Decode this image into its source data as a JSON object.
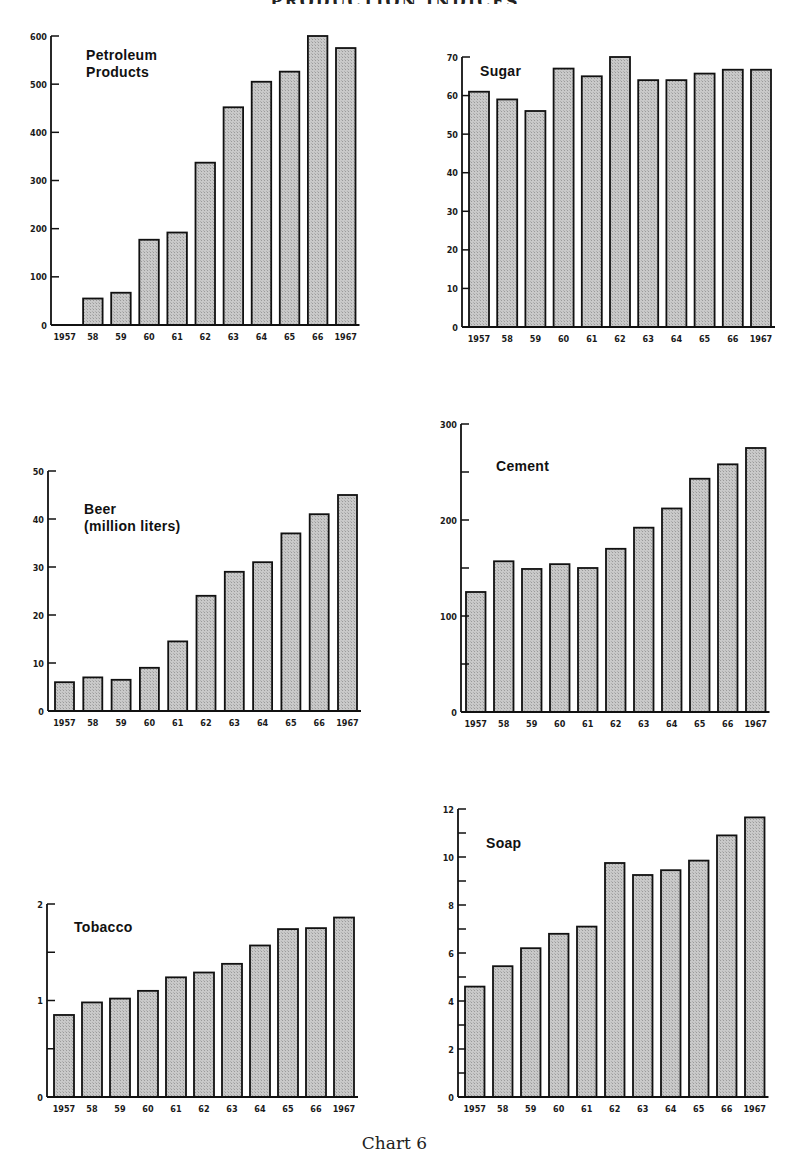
{
  "page": {
    "top_title_fragment": "PRODUCTION INDICES",
    "caption": "Chart 6"
  },
  "style": {
    "bar_fill": "#c9c9c9",
    "bar_stroke": "#111111",
    "axis_color": "#111111"
  },
  "chart_data": [
    {
      "id": "petroleum",
      "type": "bar",
      "title": "Petroleum\nProducts",
      "categories": [
        "1957",
        "58",
        "59",
        "60",
        "61",
        "62",
        "63",
        "64",
        "65",
        "66",
        "1967"
      ],
      "values": [
        0,
        55,
        67,
        177,
        192,
        337,
        452,
        505,
        526,
        600,
        575
      ],
      "yticks": [
        0,
        100,
        200,
        300,
        400,
        500,
        600
      ],
      "ytick_labels": [
        "0",
        "100",
        "200",
        "300",
        "400",
        "500",
        "600"
      ],
      "ylim": [
        0,
        600
      ],
      "xlabel": "",
      "ylabel": "",
      "grid": false,
      "legend": null
    },
    {
      "id": "sugar",
      "type": "bar",
      "title": "Sugar",
      "categories": [
        "1957",
        "58",
        "59",
        "60",
        "61",
        "62",
        "63",
        "64",
        "65",
        "66",
        "1967"
      ],
      "values": [
        61,
        59,
        56,
        67,
        65,
        70,
        64,
        64,
        65.7,
        66.7,
        66.7
      ],
      "yticks": [
        0,
        10,
        20,
        30,
        40,
        50,
        60,
        70
      ],
      "ytick_labels": [
        "0",
        "10",
        "20",
        "30",
        "40",
        "50",
        "60",
        "70"
      ],
      "ylim": [
        0,
        70
      ],
      "xlabel": "",
      "ylabel": "",
      "grid": false,
      "legend": null
    },
    {
      "id": "beer",
      "type": "bar",
      "title": "Beer\n(million liters)",
      "categories": [
        "1957",
        "58",
        "59",
        "60",
        "61",
        "62",
        "63",
        "64",
        "65",
        "66",
        "1967"
      ],
      "values": [
        6,
        7,
        6.5,
        9,
        14.5,
        24,
        29,
        31,
        37,
        41,
        45
      ],
      "yticks": [
        0,
        10,
        20,
        30,
        40,
        50
      ],
      "ytick_labels": [
        "0",
        "10",
        "20",
        "30",
        "40",
        "50"
      ],
      "ylim": [
        0,
        50
      ],
      "xlabel": "",
      "ylabel": "million liters",
      "grid": false,
      "legend": null
    },
    {
      "id": "cement",
      "type": "bar",
      "title": "Cement",
      "categories": [
        "1957",
        "58",
        "59",
        "60",
        "61",
        "62",
        "63",
        "64",
        "65",
        "66",
        "1967"
      ],
      "values": [
        125,
        157,
        149,
        154,
        150,
        170,
        192,
        212,
        243,
        258,
        275
      ],
      "yticks": [
        0,
        50,
        100,
        150,
        200,
        250,
        300
      ],
      "ytick_labels": [
        "0",
        "",
        "100",
        "",
        "200",
        "",
        "300"
      ],
      "ylim": [
        0,
        300
      ],
      "xlabel": "",
      "ylabel": "",
      "grid": false,
      "legend": null
    },
    {
      "id": "tobacco",
      "type": "bar",
      "title": "Tobacco",
      "categories": [
        "1957",
        "58",
        "59",
        "60",
        "61",
        "62",
        "63",
        "64",
        "65",
        "66",
        "1967"
      ],
      "values": [
        0.85,
        0.98,
        1.02,
        1.1,
        1.24,
        1.29,
        1.38,
        1.57,
        1.74,
        1.75,
        1.86
      ],
      "yticks": [
        0,
        0.5,
        1,
        1.5,
        2
      ],
      "ytick_labels": [
        "0",
        "",
        "1",
        "",
        "2"
      ],
      "ylim": [
        0,
        2
      ],
      "xlabel": "",
      "ylabel": "",
      "grid": false,
      "legend": null
    },
    {
      "id": "soap",
      "type": "bar",
      "title": "Soap",
      "categories": [
        "1957",
        "58",
        "59",
        "60",
        "61",
        "62",
        "63",
        "64",
        "65",
        "66",
        "1967"
      ],
      "values": [
        4.6,
        5.45,
        6.2,
        6.8,
        7.1,
        9.75,
        9.25,
        9.45,
        9.85,
        10.9,
        11.65
      ],
      "yticks": [
        0,
        1,
        2,
        3,
        4,
        5,
        6,
        7,
        8,
        9,
        10,
        11,
        12
      ],
      "ytick_labels": [
        "0",
        "",
        "2",
        "",
        "4",
        "",
        "6",
        "",
        "8",
        "",
        "10",
        "",
        "12"
      ],
      "ylim": [
        0,
        12
      ],
      "xlabel": "",
      "ylabel": "",
      "grid": false,
      "legend": null
    }
  ]
}
